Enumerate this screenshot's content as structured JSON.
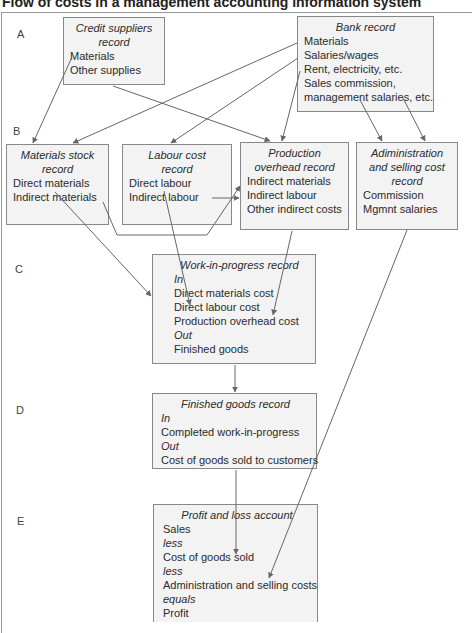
{
  "title": "Flow of costs in a management accounting information system",
  "row_labels": [
    "A",
    "B",
    "C",
    "D",
    "E"
  ],
  "boxes": {
    "credit_suppliers": {
      "heading": [
        "Credit suppliers",
        "record"
      ],
      "lines": [
        "Materials",
        "Other supplies"
      ]
    },
    "bank": {
      "heading": [
        "Bank record"
      ],
      "lines": [
        "Materials",
        "Salaries/wages",
        "Rent, electricity, etc.",
        "Sales commission,",
        "management salaries, etc."
      ]
    },
    "materials_stock": {
      "heading": [
        "Materials stock",
        "record"
      ],
      "lines": [
        "Direct materials",
        "Indirect materials"
      ]
    },
    "labour_cost": {
      "heading": [
        "Labour cost",
        "record"
      ],
      "lines": [
        "Direct labour",
        "Indirect labour"
      ]
    },
    "production_overhead": {
      "heading": [
        "Production",
        "overhead record"
      ],
      "lines": [
        "Indirect materials",
        "Indirect labour",
        "Other indirect costs"
      ]
    },
    "admin_selling": {
      "heading": [
        "Adiministration",
        "and selling cost",
        "record"
      ],
      "lines": [
        "Commission",
        "Mgmnt salaries"
      ]
    },
    "wip": {
      "heading": [
        "Work-in-progress record"
      ],
      "lines": [
        "In",
        "Direct materials cost",
        "Direct labour cost",
        "Production overhead cost",
        "Out",
        "Finished goods"
      ]
    },
    "finished_goods": {
      "heading": [
        "Finished goods record"
      ],
      "lines": [
        "In",
        "Completed work-in-progress",
        "Out",
        "Cost of goods sold to customers"
      ]
    },
    "profit_loss": {
      "heading": [
        "Profit and loss account"
      ],
      "lines": [
        "Sales",
        "less",
        "Cost of goods sold",
        "less",
        "Administration and selling costs",
        "equals",
        "Profit"
      ]
    }
  },
  "colors": {
    "box_fill": "#f3f3f3",
    "box_border": "#888888",
    "arrow": "#666666"
  }
}
